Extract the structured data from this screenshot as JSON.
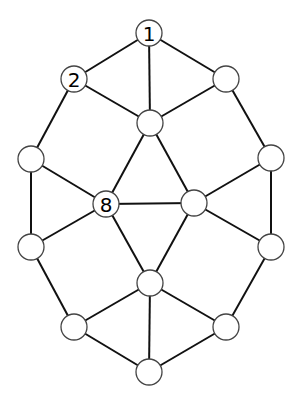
{
  "diagram": {
    "type": "graph",
    "node_radius": 13,
    "nodes": [
      {
        "id": "n1",
        "label": "1",
        "x": 149,
        "y": 33
      },
      {
        "id": "n2",
        "label": "2",
        "x": 74,
        "y": 79
      },
      {
        "id": "tr",
        "label": "",
        "x": 226,
        "y": 79
      },
      {
        "id": "ti",
        "label": "",
        "x": 150,
        "y": 123
      },
      {
        "id": "lu",
        "label": "",
        "x": 31,
        "y": 159
      },
      {
        "id": "ru",
        "label": "",
        "x": 271,
        "y": 158
      },
      {
        "id": "n8",
        "label": "8",
        "x": 106,
        "y": 204
      },
      {
        "id": "ri",
        "label": "",
        "x": 194,
        "y": 203
      },
      {
        "id": "ll",
        "label": "",
        "x": 31,
        "y": 247
      },
      {
        "id": "rl",
        "label": "",
        "x": 271,
        "y": 247
      },
      {
        "id": "li",
        "label": "",
        "x": 150,
        "y": 283
      },
      {
        "id": "bl",
        "label": "",
        "x": 74,
        "y": 327
      },
      {
        "id": "br",
        "label": "",
        "x": 226,
        "y": 327
      },
      {
        "id": "b",
        "label": "",
        "x": 149,
        "y": 372
      }
    ],
    "edges": [
      [
        "n1",
        "n2"
      ],
      [
        "n1",
        "tr"
      ],
      [
        "n1",
        "ti"
      ],
      [
        "n2",
        "ti"
      ],
      [
        "tr",
        "ti"
      ],
      [
        "n2",
        "lu"
      ],
      [
        "tr",
        "ru"
      ],
      [
        "lu",
        "n8"
      ],
      [
        "lu",
        "ll"
      ],
      [
        "ti",
        "n8"
      ],
      [
        "ti",
        "ri"
      ],
      [
        "n8",
        "ri"
      ],
      [
        "ru",
        "ri"
      ],
      [
        "ru",
        "rl"
      ],
      [
        "n8",
        "ll"
      ],
      [
        "ri",
        "rl"
      ],
      [
        "n8",
        "li"
      ],
      [
        "ri",
        "li"
      ],
      [
        "ll",
        "bl"
      ],
      [
        "rl",
        "br"
      ],
      [
        "li",
        "bl"
      ],
      [
        "li",
        "br"
      ],
      [
        "li",
        "b"
      ],
      [
        "bl",
        "b"
      ],
      [
        "br",
        "b"
      ]
    ]
  }
}
